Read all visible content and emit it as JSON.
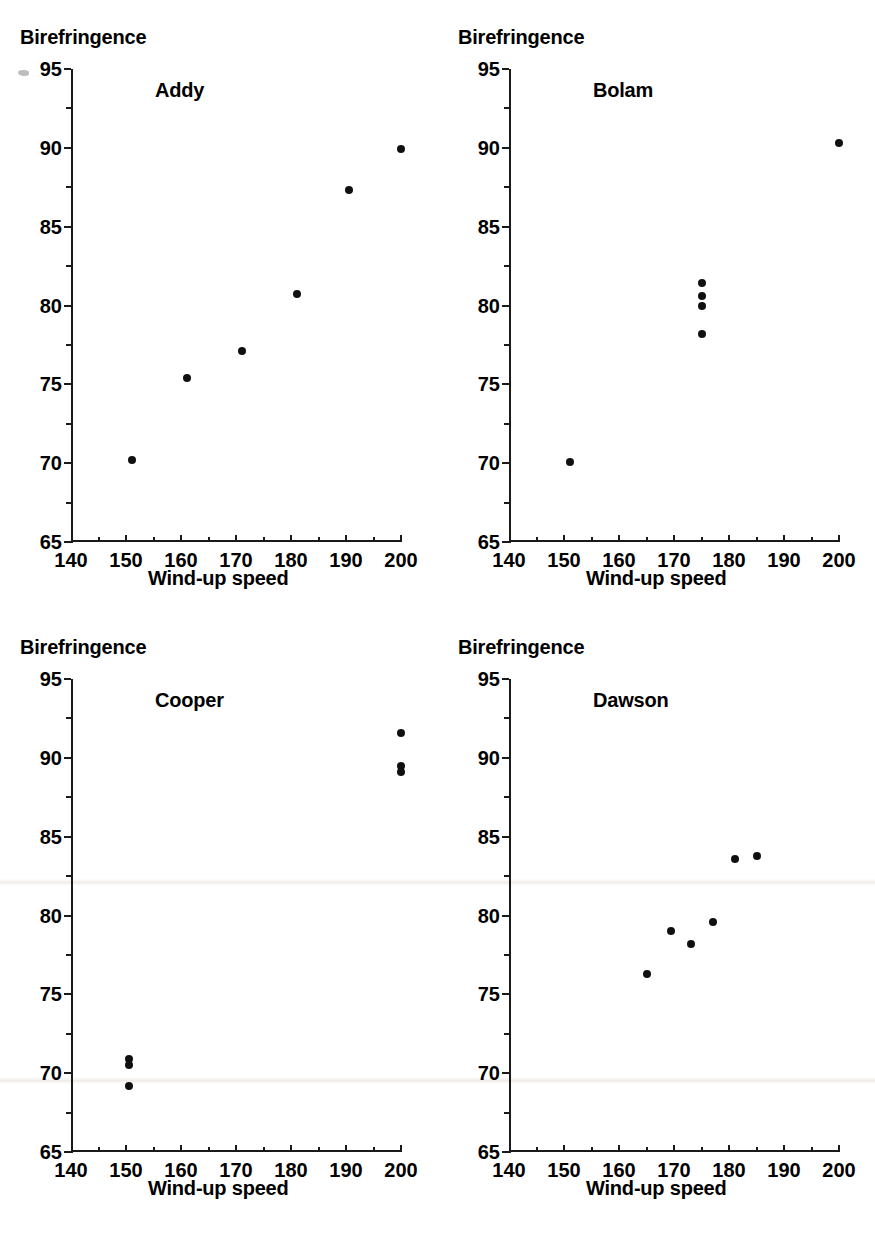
{
  "figure": {
    "axis_titles": {
      "y": "Birefringence",
      "x": "Wind-up speed"
    },
    "y_ticks": [
      "65",
      "70",
      "75",
      "80",
      "85",
      "90",
      "95"
    ],
    "x_ticks": [
      "140",
      "150",
      "160",
      "170",
      "180",
      "190",
      "200"
    ],
    "marker_color": "#101010",
    "axis_color": "#1a1a1a"
  },
  "chart_data": [
    {
      "type": "scatter",
      "title": "Addy",
      "xlabel": "Wind-up speed",
      "ylabel": "Birefringence",
      "xlim": [
        140,
        200
      ],
      "ylim": [
        65,
        95
      ],
      "xticks": [
        140,
        150,
        160,
        170,
        180,
        190,
        200
      ],
      "yticks": [
        65,
        70,
        75,
        80,
        85,
        90,
        95
      ],
      "grid": false,
      "legend": "none",
      "points": [
        {
          "x": 151.0,
          "y": 70.2
        },
        {
          "x": 161.0,
          "y": 75.4
        },
        {
          "x": 171.0,
          "y": 77.1
        },
        {
          "x": 181.0,
          "y": 80.7
        },
        {
          "x": 190.5,
          "y": 87.3
        },
        {
          "x": 200.0,
          "y": 89.9
        }
      ]
    },
    {
      "type": "scatter",
      "title": "Bolam",
      "xlabel": "Wind-up speed",
      "ylabel": "Birefringence",
      "xlim": [
        140,
        200
      ],
      "ylim": [
        65,
        95
      ],
      "xticks": [
        140,
        150,
        160,
        170,
        180,
        190,
        200
      ],
      "yticks": [
        65,
        70,
        75,
        80,
        85,
        90,
        95
      ],
      "grid": false,
      "legend": "none",
      "points": [
        {
          "x": 151.0,
          "y": 70.1
        },
        {
          "x": 175.0,
          "y": 78.2
        },
        {
          "x": 175.0,
          "y": 80.0
        },
        {
          "x": 175.0,
          "y": 80.6
        },
        {
          "x": 175.0,
          "y": 81.4
        },
        {
          "x": 200.0,
          "y": 90.3
        }
      ]
    },
    {
      "type": "scatter",
      "title": "Cooper",
      "xlabel": "Wind-up speed",
      "ylabel": "Birefringence",
      "xlim": [
        140,
        200
      ],
      "ylim": [
        65,
        95
      ],
      "xticks": [
        140,
        150,
        160,
        170,
        180,
        190,
        200
      ],
      "yticks": [
        65,
        70,
        75,
        80,
        85,
        90,
        95
      ],
      "grid": false,
      "legend": "none",
      "points": [
        {
          "x": 150.5,
          "y": 69.2
        },
        {
          "x": 150.5,
          "y": 70.5
        },
        {
          "x": 150.5,
          "y": 70.9
        },
        {
          "x": 200.0,
          "y": 89.1
        },
        {
          "x": 200.0,
          "y": 89.5
        },
        {
          "x": 200.0,
          "y": 91.6
        }
      ]
    },
    {
      "type": "scatter",
      "title": "Dawson",
      "xlabel": "Wind-up speed",
      "ylabel": "Birefringence",
      "xlim": [
        140,
        200
      ],
      "ylim": [
        65,
        95
      ],
      "xticks": [
        140,
        150,
        160,
        170,
        180,
        190,
        200
      ],
      "yticks": [
        65,
        70,
        75,
        80,
        85,
        90,
        95
      ],
      "grid": false,
      "legend": "none",
      "points": [
        {
          "x": 165.0,
          "y": 76.3
        },
        {
          "x": 169.5,
          "y": 79.0
        },
        {
          "x": 173.0,
          "y": 78.2
        },
        {
          "x": 177.0,
          "y": 79.6
        },
        {
          "x": 181.0,
          "y": 83.6
        },
        {
          "x": 185.0,
          "y": 83.8
        }
      ]
    }
  ]
}
